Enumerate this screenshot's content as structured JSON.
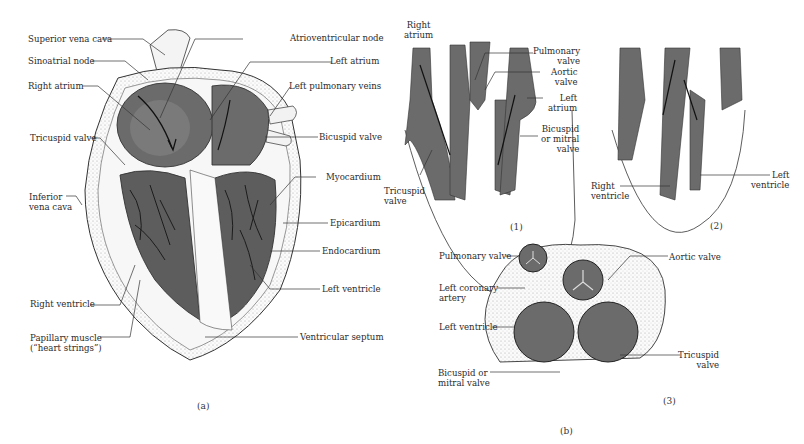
{
  "figure": {
    "panel_a": {
      "caption": "(a)",
      "labels_left": [
        {
          "id": "superior-vena-cava",
          "text": "Superior vena cava"
        },
        {
          "id": "sinoatrial-node",
          "text": "Sinoatrial node"
        },
        {
          "id": "right-atrium",
          "text": "Right atrium"
        },
        {
          "id": "tricuspid-valve",
          "text": "Tricuspid valve"
        },
        {
          "id": "inferior-vena-cava",
          "line1": "Inferior",
          "line2": "vena cava"
        },
        {
          "id": "right-ventricle",
          "text": "Right ventricle"
        },
        {
          "id": "papillary-muscle",
          "line1": "Papillary muscle",
          "line2": "(“heart strings”)"
        }
      ],
      "labels_right": [
        {
          "id": "atrioventricular-node",
          "text": "Atrioventricular node"
        },
        {
          "id": "left-atrium",
          "text": "Left atrium"
        },
        {
          "id": "left-pulmonary-veins",
          "text": "Left pulmonary veins"
        },
        {
          "id": "bicuspid-valve",
          "text": "Bicuspid valve"
        },
        {
          "id": "myocardium",
          "text": "Myocardium"
        },
        {
          "id": "epicardium",
          "text": "Epicardium"
        },
        {
          "id": "endocardium",
          "text": "Endocardium"
        },
        {
          "id": "left-ventricle",
          "text": "Left ventricle"
        },
        {
          "id": "ventricular-septum",
          "text": "Ventricular septum"
        }
      ]
    },
    "panel_b": {
      "caption": "(b)",
      "sub1": {
        "caption": "(1)",
        "right_atrium": {
          "line1": "Right",
          "line2": "atrium"
        },
        "tricuspid_valve": {
          "line1": "Tricuspid",
          "line2": "valve"
        },
        "pulmonary_valve": {
          "line1": "Pulmonary",
          "line2": "valve"
        },
        "aortic_valve": {
          "line1": "Aortic",
          "line2": "valve"
        },
        "left_atrium": {
          "line1": "Left",
          "line2": "atrium"
        },
        "bicuspid_valve": {
          "line1": "Bicuspid",
          "line2": "or mitral",
          "line3": "valve"
        }
      },
      "sub2": {
        "caption": "(2)",
        "right_ventricle": {
          "line1": "Right",
          "line2": "ventricle"
        },
        "left_ventricle": {
          "line1": "Left",
          "line2": "ventricle"
        }
      },
      "sub3": {
        "caption": "(3)",
        "pulmonary_valve": "Pulmonary valve",
        "left_coronary_artery": {
          "line1": "Left coronary",
          "line2": "artery"
        },
        "left_ventricle": "Left ventricle",
        "bicuspid_valve": {
          "line1": "Bicuspid or",
          "line2": "mitral valve"
        },
        "aortic_valve": "Aortic valve",
        "tricuspid_valve": {
          "line1": "Tricuspid",
          "line2": "valve"
        }
      }
    },
    "colors": {
      "tissue": "#6b6b6b",
      "tissue_dark": "#4a4a4a",
      "line": "#222222",
      "paper": "#ffffff"
    }
  }
}
